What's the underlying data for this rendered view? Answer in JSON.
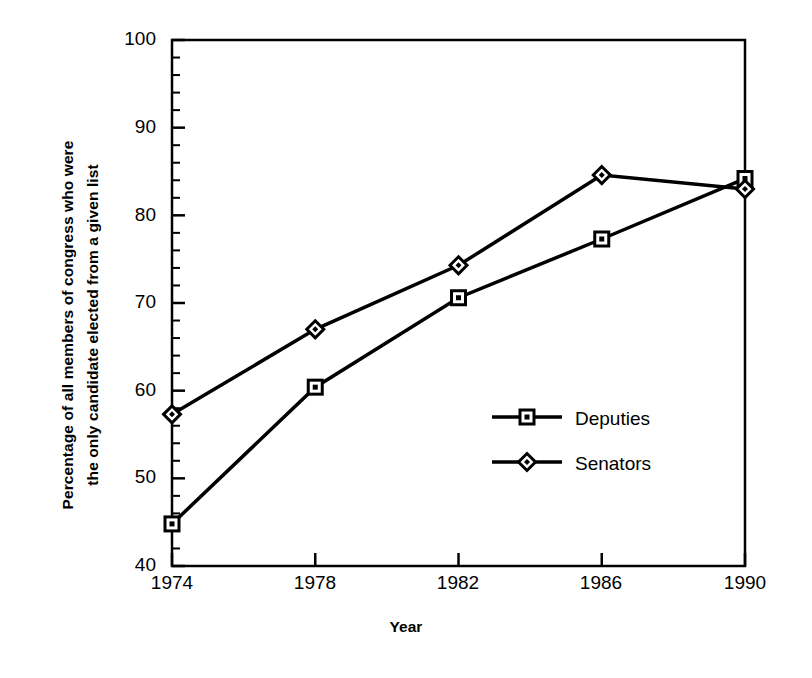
{
  "chart_data": {
    "type": "line",
    "title": "",
    "subtitle": "",
    "xlabel": "Year",
    "ylabel": "Percentage of all members of congress who were the only candidate elected from a given list",
    "ylabel_lines": [
      "Percentage of all members of congress who were",
      "the only candidate elected from a given list"
    ],
    "x": [
      1974,
      1978,
      1982,
      1986,
      1990
    ],
    "categories": [
      "1974",
      "1978",
      "1982",
      "1986",
      "1990"
    ],
    "xtick_labels": [
      "1974",
      "1978",
      "1982",
      "1986",
      "1990"
    ],
    "ytick_labels": [
      "40",
      "50",
      "60",
      "70",
      "80",
      "90",
      "100"
    ],
    "ytick_values": [
      40,
      50,
      60,
      70,
      80,
      90,
      100
    ],
    "yminor_step": 2,
    "xlim": [
      1974,
      1990
    ],
    "ylim": [
      40,
      100
    ],
    "grid": false,
    "legend_position": "center-right",
    "frame": "box",
    "line_color": "#000000",
    "background_color": "#ffffff",
    "series": [
      {
        "name": "Deputies",
        "marker": "square",
        "values": [
          44.8,
          60.4,
          70.6,
          77.3,
          84.2
        ]
      },
      {
        "name": "Senators",
        "marker": "diamond",
        "values": [
          57.3,
          67.0,
          74.3,
          84.6,
          83.0
        ]
      }
    ]
  },
  "legend": {
    "items": [
      {
        "label": "Deputies",
        "marker": "square"
      },
      {
        "label": "Senators",
        "marker": "diamond"
      }
    ]
  },
  "axes": {
    "x_title": "Year",
    "y_title_line1": "Percentage of all members of congress who were",
    "y_title_line2": "the only candidate elected from a given list",
    "y_ticks": [
      {
        "label": "100"
      },
      {
        "label": "90"
      },
      {
        "label": "80"
      },
      {
        "label": "70"
      },
      {
        "label": "60"
      },
      {
        "label": "50"
      },
      {
        "label": "40"
      }
    ],
    "x_ticks": [
      {
        "label": "1974"
      },
      {
        "label": "1978"
      },
      {
        "label": "1982"
      },
      {
        "label": "1986"
      },
      {
        "label": "1990"
      }
    ]
  }
}
